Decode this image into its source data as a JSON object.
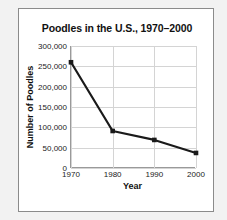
{
  "chart_data": {
    "type": "line",
    "title": "Poodles in the U.S., 1970–2000",
    "xlabel": "Year",
    "ylabel": "Number of Poodles",
    "x": [
      1970,
      1980,
      1990,
      2000
    ],
    "categories": [
      "1970",
      "1980",
      "1990",
      "2000"
    ],
    "values": [
      260000,
      91000,
      69000,
      37000
    ],
    "series": [
      {
        "name": "Number of Poodles",
        "values": [
          260000,
          91000,
          69000,
          37000
        ]
      }
    ],
    "xlim": [
      1970,
      2000
    ],
    "ylim": [
      0,
      300000
    ],
    "ytick_values": [
      0,
      50000,
      100000,
      150000,
      200000,
      250000,
      300000
    ],
    "ytick_labels": [
      "0",
      "50,000",
      "100,000",
      "150,000",
      "200,000",
      "250,000",
      "300,000"
    ],
    "xtick_labels": [
      "1970",
      "1980",
      "1990",
      "2000"
    ],
    "grid": true,
    "legend": false,
    "marker": "square",
    "line_color": "#1a1a1a",
    "grid_color": "#d4d4d4",
    "axis_color": "#9a9a9a",
    "background_color": "#ffffff"
  }
}
